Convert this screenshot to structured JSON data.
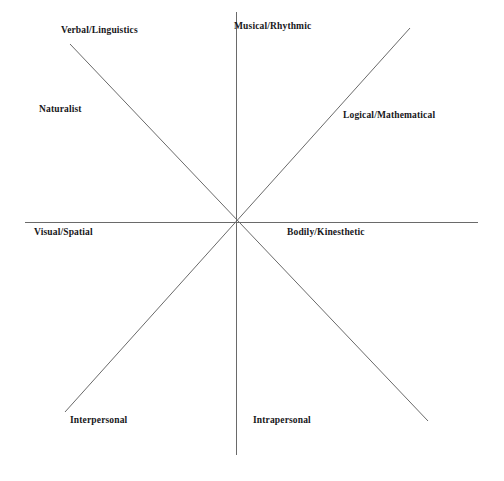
{
  "diagram": {
    "type": "radial-spoke-diagram",
    "background_color": "#ffffff",
    "line_color": "#6a6a6a",
    "text_color": "#17171a",
    "center": {
      "x": 236,
      "y": 222
    },
    "axes": [
      {
        "name": "vertical-axis",
        "x1": 236,
        "y1": 12,
        "x2": 236,
        "y2": 455
      },
      {
        "name": "horizontal-axis",
        "x1": 25,
        "y1": 222,
        "x2": 478,
        "y2": 222
      },
      {
        "name": "diagonal-nwse-axis",
        "x1": 70,
        "y1": 44,
        "x2": 428,
        "y2": 421
      },
      {
        "name": "diagonal-swne-axis",
        "x1": 65,
        "y1": 412,
        "x2": 410,
        "y2": 28
      }
    ],
    "labels": [
      {
        "id": "verbal",
        "text": "Verbal/Linguistics"
      },
      {
        "id": "musical",
        "text": "Musical/Rhythmic"
      },
      {
        "id": "naturalist",
        "text": "Naturalist"
      },
      {
        "id": "logical",
        "text": "Logical/Mathematical"
      },
      {
        "id": "visual",
        "text": "Visual/Spatial"
      },
      {
        "id": "bodily",
        "text": "Bodily/Kinesthetic"
      },
      {
        "id": "interpersonal",
        "text": "Interpersonal"
      },
      {
        "id": "intrapersonal",
        "text": "Intrapersonal"
      }
    ]
  }
}
